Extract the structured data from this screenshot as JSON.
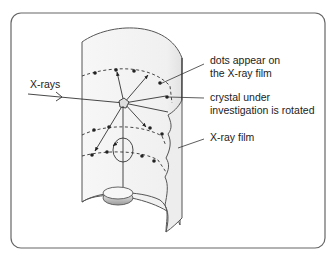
{
  "diagram": {
    "labels": {
      "xrays": "X-rays",
      "dots_line1": "dots appear on",
      "dots_line2": "the X-ray film",
      "crystal_line1": "crystal under",
      "crystal_line2": "investigation is rotated",
      "film": "X-ray film"
    },
    "colors": {
      "frame": "#555555",
      "line": "#333333",
      "film_fill": "#f4f4f4",
      "dot": "#222222"
    }
  }
}
